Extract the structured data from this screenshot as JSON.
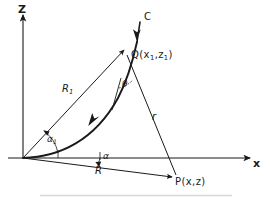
{
  "figure": {
    "type": "geometry-diagram",
    "background_color": "#ffffff",
    "line_color": "#1a1a1a",
    "axes": {
      "vertical_label": "Z",
      "horizontal_label": "x",
      "origin_label": ""
    },
    "points": [
      {
        "name": "Q",
        "label": "Q(x",
        "label_sub1": "1",
        "label_mid": ",z",
        "label_sub2": "1",
        "label_end": ")"
      },
      {
        "name": "P",
        "label": "P(x,z)"
      }
    ],
    "segments": [
      {
        "name": "R1",
        "label": "R",
        "label_sub": "1"
      },
      {
        "name": "R",
        "label": "R"
      },
      {
        "name": "r",
        "label": "r"
      }
    ],
    "angles": [
      {
        "name": "alpha1",
        "label": "α",
        "label_sub": "1"
      },
      {
        "name": "alpha",
        "label": "α"
      },
      {
        "name": "theta",
        "label": "θ"
      }
    ],
    "curve": {
      "name": "C",
      "label": "C"
    },
    "caption": ""
  }
}
